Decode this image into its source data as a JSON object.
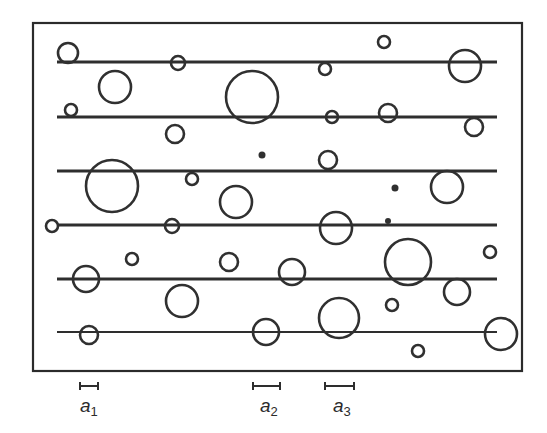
{
  "figure": {
    "frame": {
      "x": 33,
      "y": 23,
      "width": 222,
      "height": 149,
      "note": "scaled coordinates are in the SVG below"
    },
    "lines": [
      {
        "y": 62,
        "x1": 57,
        "x2": 497,
        "weight": "thick"
      },
      {
        "y": 117,
        "x1": 57,
        "x2": 497,
        "weight": "thick"
      },
      {
        "y": 171,
        "x1": 57,
        "x2": 497,
        "weight": "thick"
      },
      {
        "y": 225,
        "x1": 57,
        "x2": 497,
        "weight": "thick"
      },
      {
        "y": 279,
        "x1": 57,
        "x2": 497,
        "weight": "thick"
      },
      {
        "y": 332,
        "x1": 57,
        "x2": 497,
        "weight": "thin"
      }
    ],
    "circles": [
      {
        "cx": 68,
        "cy": 53,
        "r": 10
      },
      {
        "cx": 178,
        "cy": 63,
        "r": 7
      },
      {
        "cx": 384,
        "cy": 42,
        "r": 6
      },
      {
        "cx": 325,
        "cy": 69,
        "r": 6
      },
      {
        "cx": 465,
        "cy": 66,
        "r": 16
      },
      {
        "cx": 115,
        "cy": 87,
        "r": 16
      },
      {
        "cx": 252,
        "cy": 97,
        "r": 26
      },
      {
        "cx": 71,
        "cy": 110,
        "r": 6
      },
      {
        "cx": 332,
        "cy": 117,
        "r": 6
      },
      {
        "cx": 388,
        "cy": 113,
        "r": 9
      },
      {
        "cx": 474,
        "cy": 127,
        "r": 9
      },
      {
        "cx": 175,
        "cy": 134,
        "r": 9
      },
      {
        "cx": 328,
        "cy": 160,
        "r": 9
      },
      {
        "cx": 112,
        "cy": 186,
        "r": 26
      },
      {
        "cx": 192,
        "cy": 179,
        "r": 6
      },
      {
        "cx": 447,
        "cy": 187,
        "r": 16
      },
      {
        "cx": 236,
        "cy": 202,
        "r": 16
      },
      {
        "cx": 52,
        "cy": 226,
        "r": 6
      },
      {
        "cx": 172,
        "cy": 226,
        "r": 7
      },
      {
        "cx": 336,
        "cy": 228,
        "r": 16
      },
      {
        "cx": 132,
        "cy": 259,
        "r": 6
      },
      {
        "cx": 229,
        "cy": 262,
        "r": 9
      },
      {
        "cx": 408,
        "cy": 262,
        "r": 23
      },
      {
        "cx": 490,
        "cy": 252,
        "r": 6
      },
      {
        "cx": 86,
        "cy": 279,
        "r": 13
      },
      {
        "cx": 292,
        "cy": 272,
        "r": 13
      },
      {
        "cx": 457,
        "cy": 292,
        "r": 13
      },
      {
        "cx": 182,
        "cy": 301,
        "r": 16
      },
      {
        "cx": 392,
        "cy": 305,
        "r": 6
      },
      {
        "cx": 339,
        "cy": 318,
        "r": 20
      },
      {
        "cx": 89,
        "cy": 335,
        "r": 9
      },
      {
        "cx": 266,
        "cy": 332,
        "r": 13
      },
      {
        "cx": 501,
        "cy": 334,
        "r": 16
      },
      {
        "cx": 418,
        "cy": 351,
        "r": 6
      }
    ],
    "dots": [
      {
        "cx": 262,
        "cy": 155,
        "r": 3.5
      },
      {
        "cx": 395,
        "cy": 188,
        "r": 3.5
      },
      {
        "cx": 388,
        "cy": 221,
        "r": 3
      }
    ],
    "scale_bars": [
      {
        "id": "a1",
        "x1": 80,
        "x2": 98,
        "y": 386,
        "label": "a",
        "subscript": "1",
        "label_x": 80,
        "label_y": 409
      },
      {
        "id": "a2",
        "x1": 253,
        "x2": 280,
        "y": 386,
        "label": "a",
        "subscript": "2",
        "label_x": 260,
        "label_y": 409
      },
      {
        "id": "a3",
        "x1": 325,
        "x2": 354,
        "y": 386,
        "label": "a",
        "subscript": "3",
        "label_x": 333,
        "label_y": 409
      }
    ]
  },
  "labels": {
    "a1": "a",
    "a1_sub": "1",
    "a2": "a",
    "a2_sub": "2",
    "a3": "a",
    "a3_sub": "3"
  }
}
